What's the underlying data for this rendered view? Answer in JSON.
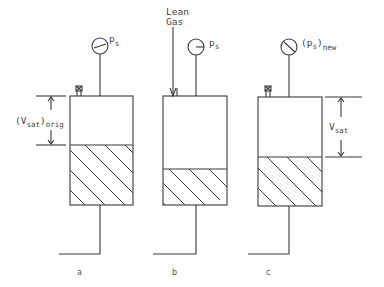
{
  "figure": {
    "panels": [
      {
        "id": "a",
        "label": "a",
        "gauge_label": "p",
        "gauge_sub": "s",
        "gauge_state": "normal",
        "has_valve": true,
        "dimension_label": "(V",
        "dimension_sub": "sat",
        "dimension_suffix": ")",
        "dimension_suffix_sub": "orig",
        "liquid_level": "high"
      },
      {
        "id": "b",
        "label": "b",
        "gauge_label": "p",
        "gauge_sub": "s",
        "gauge_state": "normal",
        "has_inlet": true,
        "inlet_label_line1": "Lean",
        "inlet_label_line2": "Gas",
        "liquid_level": "low"
      },
      {
        "id": "c",
        "label": "c",
        "gauge_label": "(p",
        "gauge_sub": "s",
        "gauge_suffix": ")",
        "gauge_suffix_sub": "new",
        "gauge_state": "changed",
        "has_valve": true,
        "dimension_label": "V",
        "dimension_sub": "sat",
        "liquid_level": "medium"
      }
    ],
    "colors": {
      "line": "#3a3a3a",
      "background": "#ffffff"
    }
  }
}
